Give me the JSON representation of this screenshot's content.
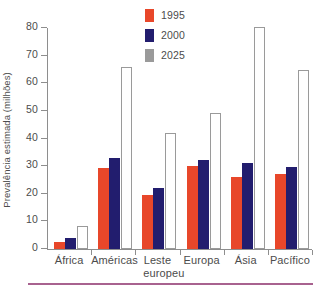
{
  "chart_data": {
    "type": "bar",
    "title": "",
    "xlabel": "",
    "ylabel": "Prevalência estimada (milhões)",
    "ylim": [
      0,
      80
    ],
    "yticks": [
      0,
      10,
      20,
      30,
      40,
      50,
      60,
      70,
      80
    ],
    "grid": false,
    "legend_position": "top-center",
    "categories": [
      "África",
      "Américas",
      "Leste europeu",
      "Europa",
      "Ásia",
      "Pacífico"
    ],
    "category_lines": [
      [
        "África"
      ],
      [
        "Américas"
      ],
      [
        "Leste",
        "europeu"
      ],
      [
        "Europa"
      ],
      [
        "Ásia"
      ],
      [
        "Pacífico"
      ]
    ],
    "series": [
      {
        "name": "1995",
        "color": "#e8472a",
        "values": [
          2.5,
          29.2,
          19.4,
          30.0,
          26.0,
          27.2
        ]
      },
      {
        "name": "2000",
        "color": "#221d6e",
        "values": [
          4.0,
          33.0,
          22.2,
          32.4,
          31.0,
          29.6
        ]
      },
      {
        "name": "2025",
        "color": "#9a9a9a",
        "values": [
          8.2,
          66.0,
          42.0,
          49.4,
          80.5,
          64.8
        ]
      }
    ]
  },
  "legend": {
    "items": [
      {
        "label": "1995",
        "color": "#e8472a"
      },
      {
        "label": "2000",
        "color": "#221d6e"
      },
      {
        "label": "2025",
        "color": "#9a9a9a"
      }
    ]
  },
  "axes": {
    "y_title": "Prevalência estimada (milhões)",
    "y_tick_labels": [
      "0",
      "10",
      "20",
      "30",
      "40",
      "50",
      "60",
      "70",
      "80"
    ]
  },
  "caption": {
    "text": ""
  }
}
